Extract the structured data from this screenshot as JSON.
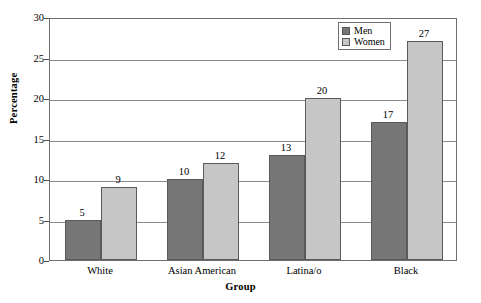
{
  "chart_data": {
    "type": "bar",
    "title": "",
    "xlabel": "Group",
    "ylabel": "Percentage",
    "categories": [
      "White",
      "Asian American",
      "Latina/o",
      "Black"
    ],
    "series": [
      {
        "name": "Men",
        "values": [
          5,
          10,
          13,
          17
        ],
        "color": "#767676"
      },
      {
        "name": "Women",
        "values": [
          9,
          12,
          20,
          27
        ],
        "color": "#c6c6c6"
      }
    ],
    "ylim": [
      0,
      30
    ],
    "yticks": [
      0,
      5,
      10,
      15,
      20,
      25,
      30
    ],
    "ytick_labels": [
      "0",
      "5",
      "10",
      "15",
      "20",
      "25",
      "30"
    ],
    "grid": true,
    "grid_axis": "y",
    "legend_position": "top-right",
    "show_value_labels": true
  },
  "legend": {
    "entries": [
      {
        "label": "Men"
      },
      {
        "label": "Women"
      }
    ]
  },
  "axes": {
    "y_title": "Percentage",
    "x_title": "Group"
  },
  "colors": {
    "men_bar": "#767676",
    "women_bar": "#c6c6c6",
    "frame": "#6e6e6e",
    "gridline": "#8a8a8a",
    "background": "#ffffff"
  }
}
